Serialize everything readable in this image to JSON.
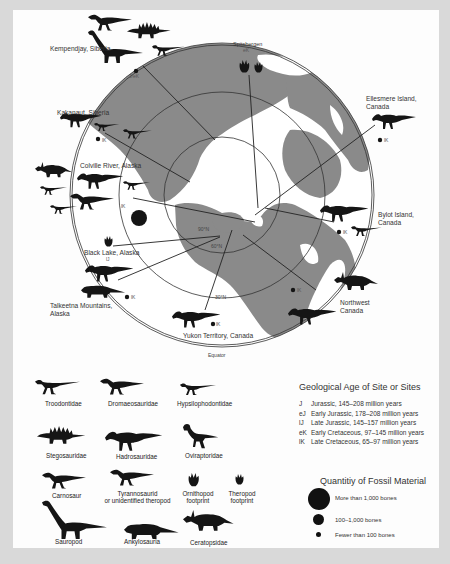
{
  "map": {
    "ring_labels": {
      "pole": "90°N",
      "lat60": "60°N",
      "lat30": "30°N",
      "equator": "Equator"
    },
    "colors": {
      "background": "#d9d9d9",
      "panel": "#fdfdfd",
      "land": "#8a8a8a",
      "ocean": "#ffffff",
      "silhouette": "#151515",
      "lines": "#222222"
    },
    "sites": [
      {
        "name": "Kempendjay, Siberia",
        "age": "J/eK",
        "fossil_quantity": "Fewer than 100 bones",
        "fauna": [
          "Carnosaur",
          "Stegosauridae",
          "Sauropod",
          "Tyrannosaurid or unidentified theropod"
        ]
      },
      {
        "name": "Spitsbergen",
        "age": "eK",
        "fossil_quantity": "",
        "fauna": [
          "Ornithopod footprint",
          "Theropod footprint"
        ]
      },
      {
        "name": "Ellesmere Island, Canada",
        "age": "lK",
        "fossil_quantity": "Fewer than 100 bones",
        "fauna": [
          "Hadrosauridae"
        ]
      },
      {
        "name": "Kakanaut, Siberia",
        "age": "lK",
        "fossil_quantity": "Fewer than 100 bones",
        "fauna": [
          "Hadrosauridae",
          "Troodontidae",
          "Dromaeosauridae"
        ]
      },
      {
        "name": "Colville River, Alaska",
        "age": "lK",
        "fossil_quantity": "More than 1,000 bones",
        "fauna": [
          "Ceratopsidae",
          "Hadrosauridae",
          "Hypsilophodontidae",
          "Troodontidae",
          "Tyrannosaurid or unidentified theropod",
          "Dromaeosauridae"
        ]
      },
      {
        "name": "Black Lake, Alaska",
        "age": "lJ",
        "fossil_quantity": "",
        "fauna": [
          "Theropod footprint"
        ]
      },
      {
        "name": "Talkeetna Mountains, Alaska",
        "age": "lK",
        "fossil_quantity": "Fewer than 100 bones",
        "fauna": [
          "Hadrosauridae",
          "Ankylosauria"
        ]
      },
      {
        "name": "Yukon Territory, Canada",
        "age": "lK",
        "fossil_quantity": "Fewer than 100 bones",
        "fauna": [
          "Hadrosauridae"
        ]
      },
      {
        "name": "Bylot Island, Canada",
        "age": "lK",
        "fossil_quantity": "Fewer than 100 bones",
        "fauna": [
          "Hadrosauridae",
          "Dromaeosauridae"
        ]
      },
      {
        "name": "Northwest Canada",
        "age": "lK",
        "fossil_quantity": "Fewer than 100 bones",
        "fauna": [
          "Ceratopsidae",
          "Hadrosauridae"
        ]
      }
    ],
    "labels": {
      "kempendjay": "Kempendjay, Siberia",
      "kempendjay_age": "J/eK",
      "spitsbergen": "Spitsbergen",
      "spitsbergen_age": "eK",
      "ellesmere_1": "Ellesmere Island,",
      "ellesmere_2": "Canada",
      "ellesmere_age": "lK",
      "kakanaut": "Kakanaut, Siberia",
      "kakanaut_age": "lK",
      "colville": "Colville River, Alaska",
      "colville_age": "lK",
      "blacklake": "Black Lake, Alaska",
      "blacklake_age": "lJ",
      "talkeetna_1": "Talkeetna Mountains,",
      "talkeetna_2": "Alaska",
      "talkeetna_age": "lK",
      "yukon": "Yukon Territory, Canada",
      "yukon_age": "lK",
      "bylot_1": "Bylot Island,",
      "bylot_2": "Canada",
      "bylot_age": "lK",
      "nwcanada_1": "Northwest",
      "nwcanada_2": "Canada",
      "nwcanada_age": "lK"
    }
  },
  "legend": {
    "taxa": [
      {
        "name": "Troodontidae",
        "icon": "troodontid-silhouette"
      },
      {
        "name": "Dromaeosauridae",
        "icon": "dromaeosaur-silhouette"
      },
      {
        "name": "Hypsilophodontidae",
        "icon": "hypsilophodont-silhouette"
      },
      {
        "name": "Stegosauridae",
        "icon": "stegosaur-silhouette"
      },
      {
        "name": "Hadrosauridae",
        "icon": "hadrosaur-silhouette"
      },
      {
        "name": "Oviraptoridae",
        "icon": "oviraptor-silhouette"
      },
      {
        "name": "Carnosaur",
        "icon": "carnosaur-silhouette"
      },
      {
        "name": "Tyrannosaurid",
        "name2": "or unidentified theropod",
        "icon": "tyrannosaur-silhouette"
      },
      {
        "name": "Ornithopod",
        "name2": "footprint",
        "icon": "ornithopod-footprint"
      },
      {
        "name": "Theropod",
        "name2": "footprint",
        "icon": "theropod-footprint"
      },
      {
        "name": "Sauropod",
        "icon": "sauropod-silhouette"
      },
      {
        "name": "Ankylosauria",
        "icon": "ankylosaur-silhouette"
      },
      {
        "name": "Ceratopsidae",
        "icon": "ceratopsid-silhouette"
      }
    ],
    "geological_age": {
      "title": "Geological Age of Site or Sites",
      "items": [
        {
          "abbr": "J",
          "text": "Jurassic, 145–208 million years"
        },
        {
          "abbr": "eJ",
          "text": "Early Jurassic, 178–208 million years"
        },
        {
          "abbr": "lJ",
          "text": "Late Jurassic, 145–157 million years"
        },
        {
          "abbr": "eK",
          "text": "Early Cretaceous, 97–145 million years"
        },
        {
          "abbr": "lK",
          "text": "Late Cretaceous, 65–97 million years"
        }
      ]
    },
    "fossil_quantity": {
      "title": "Quantitiy of Fossil Material",
      "items": [
        {
          "size": "large",
          "text": "More than 1,000 bones"
        },
        {
          "size": "medium",
          "text": "100–1,000 bones"
        },
        {
          "size": "small",
          "text": "Fewer than 100 bones"
        }
      ]
    }
  }
}
